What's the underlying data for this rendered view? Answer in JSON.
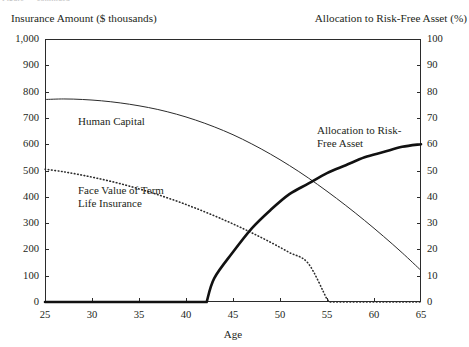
{
  "figure": {
    "cropped_caption_fragment": "Figure — continued"
  },
  "axis_titles": {
    "left": "Insurance Amount ($ thousands)",
    "right": "Allocation to Risk-Free Asset (%)",
    "x": "Age"
  },
  "ticks": {
    "left": [
      "1,000",
      "900",
      "800",
      "700",
      "600",
      "500",
      "400",
      "300",
      "200",
      "100",
      "0"
    ],
    "right": [
      "100",
      "90",
      "80",
      "70",
      "60",
      "50",
      "40",
      "30",
      "20",
      "10",
      "0"
    ],
    "x": [
      "25",
      "30",
      "35",
      "40",
      "45",
      "50",
      "55",
      "60",
      "65"
    ]
  },
  "series_labels": {
    "human_capital": "Human Capital",
    "face_value": "Face Value of Term\nLife Insurance",
    "allocation": "Allocation to Risk-\nFree Asset"
  },
  "chart_data": {
    "type": "line",
    "title": "",
    "subtitle": "",
    "xlabel": "Age",
    "ylabel": "Insurance Amount ($ thousands)",
    "y2label": "Allocation to Risk-Free Asset (%)",
    "xlim": [
      25,
      65
    ],
    "ylim": [
      0,
      1000
    ],
    "y2lim": [
      0,
      100
    ],
    "xticks": [
      25,
      30,
      35,
      40,
      45,
      50,
      55,
      60,
      65
    ],
    "yticks": [
      0,
      100,
      200,
      300,
      400,
      500,
      600,
      700,
      800,
      900,
      1000
    ],
    "y2ticks": [
      0,
      10,
      20,
      30,
      40,
      50,
      60,
      70,
      80,
      90,
      100
    ],
    "grid": false,
    "legend": "none (curves labelled inline)",
    "x": [
      25,
      27,
      29,
      31,
      33,
      35,
      37,
      39,
      41,
      43,
      45,
      47,
      49,
      51,
      53,
      55,
      57,
      59,
      61,
      63,
      65
    ],
    "series": [
      {
        "name": "Human Capital",
        "axis": "left",
        "style": "thin-solid",
        "units": "$ thousands",
        "values": [
          770,
          772,
          770,
          765,
          757,
          746,
          732,
          714,
          692,
          666,
          636,
          601,
          562,
          519,
          472,
          421,
          367,
          310,
          250,
          187,
          120
        ]
      },
      {
        "name": "Face Value of Term Life Insurance",
        "axis": "left",
        "style": "dotted",
        "units": "$ thousands",
        "values": [
          505,
          495,
          482,
          467,
          450,
          430,
          408,
          384,
          357,
          328,
          297,
          263,
          227,
          188,
          147,
          10,
          0,
          0,
          0,
          0,
          0
        ]
      },
      {
        "name": "Allocation to Risk-Free Asset",
        "axis": "right",
        "style": "thick-solid",
        "units": "%",
        "values": [
          0,
          0,
          0,
          0,
          0,
          0,
          0,
          0,
          0,
          9,
          19,
          28,
          35,
          41,
          45,
          49,
          52,
          55,
          57,
          59,
          60
        ]
      }
    ],
    "annotations": [
      {
        "text": "Human Capital",
        "x": 31,
        "y": 690,
        "axis": "left"
      },
      {
        "text": "Face Value of Term Life Insurance",
        "x": 31,
        "y": 400,
        "axis": "left"
      },
      {
        "text": "Allocation to Risk-Free Asset",
        "x": 55,
        "y": 63,
        "axis": "right"
      }
    ]
  }
}
